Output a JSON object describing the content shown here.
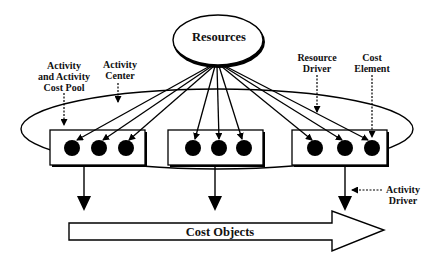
{
  "diagram": {
    "nodes": {
      "resources": "Resources",
      "cost_objects": "Cost Objects"
    },
    "annotations": {
      "activity_cost_pool": [
        "Activity",
        "and Activity",
        "Cost Pool"
      ],
      "activity_center": [
        "Activity",
        "Center"
      ],
      "resource_driver": [
        "Resource",
        "Driver"
      ],
      "cost_element": [
        "Cost",
        "Element"
      ],
      "activity_driver": [
        "Activity",
        "Driver"
      ]
    },
    "activity_boxes": [
      {
        "id": "activity-1",
        "cost_elements": 3
      },
      {
        "id": "activity-2",
        "cost_elements": 3
      },
      {
        "id": "activity-3",
        "cost_elements": 3
      }
    ],
    "colors": {
      "stroke": "#000000",
      "background": "#ffffff"
    }
  }
}
